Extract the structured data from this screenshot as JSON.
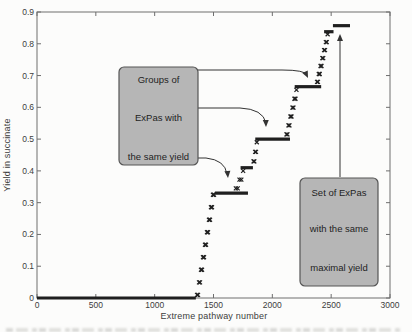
{
  "chart_data": {
    "type": "scatter",
    "title": "",
    "xlabel": "Extreme pathway number",
    "ylabel": "Yield in succinate",
    "xlim": [
      0,
      3000
    ],
    "ylim": [
      0,
      0.9
    ],
    "x_ticks": [
      0,
      500,
      1000,
      1500,
      2000,
      2500,
      3000
    ],
    "y_ticks": [
      0,
      0.1,
      0.2,
      0.3,
      0.4,
      0.5,
      0.6,
      0.7,
      0.8,
      0.9
    ],
    "grid": false,
    "legend": false,
    "marker": "x",
    "series_name": "ExPa yield (sorted ascending)",
    "plateaus": [
      {
        "x1": 0,
        "x2": 1350,
        "y": 0
      },
      {
        "x1": 1512,
        "x2": 1793,
        "y": 0.33
      },
      {
        "x1": 1730,
        "x2": 1835,
        "y": 0.41
      },
      {
        "x1": 1855,
        "x2": 2150,
        "y": 0.5
      },
      {
        "x1": 2190,
        "x2": 2415,
        "y": 0.665
      },
      {
        "x1": 2440,
        "x2": 2520,
        "y": 0.838
      },
      {
        "x1": 2515,
        "x2": 2660,
        "y": 0.857
      }
    ],
    "rises": [
      {
        "x1": 1360,
        "y1": 0.01,
        "x2": 1504,
        "y2": 0.325,
        "n": 18
      },
      {
        "x1": 1690,
        "y1": 0.345,
        "x2": 1752,
        "y2": 0.4,
        "n": 5
      },
      {
        "x1": 1840,
        "y1": 0.43,
        "x2": 1868,
        "y2": 0.49,
        "n": 5
      },
      {
        "x1": 2120,
        "y1": 0.515,
        "x2": 2205,
        "y2": 0.655,
        "n": 11
      },
      {
        "x1": 2380,
        "y1": 0.68,
        "x2": 2470,
        "y2": 0.83,
        "n": 13
      }
    ],
    "annotations": [
      {
        "id": "groups-callout",
        "lines": [
          "Groups of",
          "ExPas with",
          "the same yield"
        ],
        "box_px": {
          "x": 119,
          "y": 67,
          "w": 79,
          "h": 98
        },
        "line_offsets": [
          13,
          51,
          90
        ],
        "arrows": [
          {
            "path": "M197,70 H282 Q305,70 307,75",
            "tip": [
              308,
              78
            ],
            "angle": 155
          },
          {
            "path": "M197,108 H240 Q263,109 266,123",
            "tip": [
              266,
              127
            ],
            "angle": 178
          },
          {
            "path": "M197,158 H206 Q225,160 227,174",
            "tip": [
              228,
              178
            ],
            "angle": 175
          }
        ]
      },
      {
        "id": "maximal-callout",
        "lines": [
          "Set of ExPas",
          "with the same",
          "maximal yield"
        ],
        "box_px": {
          "x": 300,
          "y": 178,
          "w": 78,
          "h": 108
        },
        "line_offsets": [
          15,
          51,
          90
        ],
        "arrows": [
          {
            "path": "M340,177 V38",
            "tip": [
              340,
              34
            ],
            "angle": 0
          }
        ]
      }
    ],
    "colors": {
      "series": "#1f1f1f",
      "frame": "#6e6e6e",
      "tick_label": "#3c3c3c",
      "callout_fill": "#b6b6b6",
      "callout_border": "#555555",
      "callout_text": "#1e1e1e",
      "arrow": "#333333",
      "background": "#fcfcfb"
    }
  }
}
